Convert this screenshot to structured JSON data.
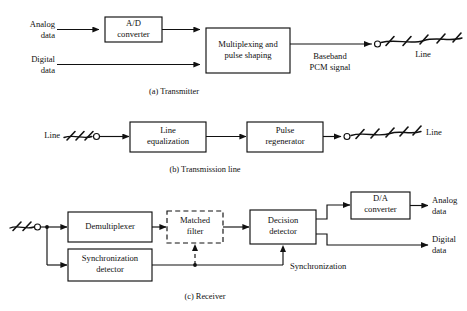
{
  "figure": {
    "background_color": "#ffffff",
    "stroke_color": "#111111"
  },
  "sections": [
    {
      "id": "transmitter",
      "caption": "(a) Transmitter",
      "blocks": [
        {
          "id": "ad-converter",
          "lines": [
            "A/D",
            "converter"
          ],
          "style": "solid"
        },
        {
          "id": "multiplexing",
          "lines": [
            "Multiplexing and",
            "pulse shaping"
          ],
          "style": "solid"
        }
      ],
      "labels": [
        {
          "id": "analog-data-in",
          "lines": [
            "Analog",
            "data"
          ]
        },
        {
          "id": "digital-data-in",
          "lines": [
            "Digital",
            "data"
          ]
        },
        {
          "id": "baseband-pcm-signal",
          "lines": [
            "Baseband",
            "PCM signal"
          ]
        },
        {
          "id": "line-out",
          "lines": [
            "Line"
          ]
        }
      ]
    },
    {
      "id": "transmission-line",
      "caption": "(b) Transmission line",
      "blocks": [
        {
          "id": "line-equalization",
          "lines": [
            "Line",
            "equalization"
          ],
          "style": "solid"
        },
        {
          "id": "pulse-regenerator",
          "lines": [
            "Pulse",
            "regenerator"
          ],
          "style": "solid"
        }
      ],
      "labels": [
        {
          "id": "line-in",
          "lines": [
            "Line"
          ]
        },
        {
          "id": "line-out",
          "lines": [
            "Line"
          ]
        }
      ]
    },
    {
      "id": "receiver",
      "caption": "(c) Receiver",
      "blocks": [
        {
          "id": "demultiplexer",
          "lines": [
            "Demultiplexer"
          ],
          "style": "solid"
        },
        {
          "id": "matched-filter",
          "lines": [
            "Matched",
            "filter"
          ],
          "style": "dashed"
        },
        {
          "id": "decision-detector",
          "lines": [
            "Decision",
            "detector"
          ],
          "style": "solid"
        },
        {
          "id": "da-converter",
          "lines": [
            "D/A",
            "converter"
          ],
          "style": "solid"
        },
        {
          "id": "synchronization-detector",
          "lines": [
            "Synchronization",
            "detector"
          ],
          "style": "solid"
        }
      ],
      "labels": [
        {
          "id": "analog-data-out",
          "lines": [
            "Analog",
            "data"
          ]
        },
        {
          "id": "digital-data-out",
          "lines": [
            "Digital",
            "data"
          ]
        },
        {
          "id": "synchronization-bus",
          "lines": [
            "Synchronization"
          ]
        }
      ]
    }
  ],
  "text": {
    "a": {
      "analog_1": "Analog",
      "analog_2": "data",
      "digital_1": "Digital",
      "digital_2": "data",
      "ad_1": "A/D",
      "ad_2": "converter",
      "mux_1": "Multiplexing and",
      "mux_2": "pulse shaping",
      "baseband_1": "Baseband",
      "baseband_2": "PCM signal",
      "line": "Line",
      "caption": "(a) Transmitter"
    },
    "b": {
      "line_in": "Line",
      "eq_1": "Line",
      "eq_2": "equalization",
      "regen_1": "Pulse",
      "regen_2": "regenerator",
      "line_out": "Line",
      "caption": "(b) Transmission line"
    },
    "c": {
      "demux": "Demultiplexer",
      "matched_1": "Matched",
      "matched_2": "filter",
      "decision_1": "Decision",
      "decision_2": "detector",
      "da_1": "D/A",
      "da_2": "converter",
      "sync_1": "Synchronization",
      "sync_2": "detector",
      "analog_1": "Analog",
      "analog_2": "data",
      "digital_1": "Digital",
      "digital_2": "data",
      "sync_bus": "Synchronization",
      "caption": "(c) Receiver"
    }
  }
}
